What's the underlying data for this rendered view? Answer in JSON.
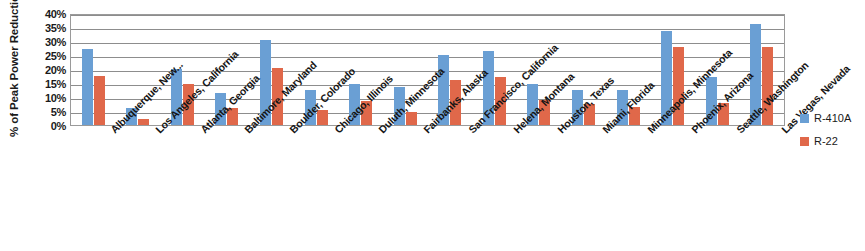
{
  "chart_data": {
    "type": "bar",
    "title": "",
    "xlabel": "",
    "ylabel": "% of Peak Power Reduction",
    "ylim": [
      0,
      40
    ],
    "ytick_labels": [
      "40%",
      "35%",
      "30%",
      "25%",
      "20%",
      "15%",
      "10%",
      "5%",
      "0%"
    ],
    "ytick_values": [
      40,
      35,
      30,
      25,
      20,
      15,
      10,
      5,
      0
    ],
    "grid": true,
    "legend_position": "right",
    "categories": [
      "Albuquerque, New...",
      "Los Angeles, California",
      "Atlanta, Georgia",
      "Baltimore, Maryland",
      "Boulder, Colorado",
      "Chicago, Illinois",
      "Duluth, Minnesota",
      "Fairbanks, Alaska",
      "San Francisco, California",
      "Helena, Montana",
      "Houston, Texas",
      "Miami, Florida",
      "Minneapolis, Minnesota",
      "Phoenix, Arizona",
      "Seattle, Washington",
      "Las Vegas, Nevada"
    ],
    "series": [
      {
        "name": "R-410A",
        "color": "#6a9fd4",
        "values": [
          27,
          6,
          20,
          11.5,
          30.5,
          12.5,
          14.5,
          13.5,
          25,
          26.5,
          14.5,
          12.5,
          12.5,
          33.5,
          17,
          36
        ]
      },
      {
        "name": "R-22",
        "color": "#e0684a",
        "values": [
          17.5,
          2,
          14.5,
          6,
          20.5,
          5.5,
          8.5,
          4.5,
          16,
          17,
          9,
          7.5,
          6.5,
          28,
          8,
          28
        ]
      }
    ]
  },
  "legend": {
    "items": [
      {
        "label": "R-410A",
        "color": "#6a9fd4"
      },
      {
        "label": "R-22",
        "color": "#e0684a"
      }
    ]
  }
}
